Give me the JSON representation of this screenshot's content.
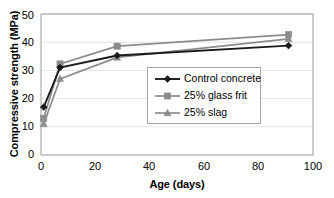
{
  "chart_data": {
    "type": "line",
    "title": "",
    "xlabel": "Age  (days)",
    "ylabel": "Compressive strength (MPa)",
    "xlim": [
      0,
      100
    ],
    "ylim": [
      0,
      50
    ],
    "xticks": [
      "0",
      "20",
      "40",
      "60",
      "80",
      "100"
    ],
    "xtick_values": [
      0,
      20,
      40,
      60,
      80,
      100
    ],
    "yticks": [
      "0",
      "10",
      "20",
      "30",
      "40",
      "50"
    ],
    "ytick_values": [
      0,
      10,
      20,
      30,
      40,
      50
    ],
    "grid": "horizontal",
    "legend_position": "center-right-inside",
    "x": [
      1,
      7,
      28,
      91
    ],
    "series": [
      {
        "name": "Control concrete",
        "marker": "diamond",
        "color": "#1a1a1a",
        "values": [
          17.0,
          31.0,
          35.3,
          38.8
        ]
      },
      {
        "name": "25% glass frit",
        "marker": "square",
        "color": "#8c8c8c",
        "values": [
          13.0,
          32.3,
          38.6,
          42.7
        ]
      },
      {
        "name": "25% slag",
        "marker": "triangle",
        "color": "#8c8c8c",
        "values": [
          11.0,
          27.0,
          34.6,
          41.2
        ]
      }
    ]
  },
  "axes": {
    "ylabel": "Compressive strength (MPa)",
    "xlabel": "Age  (days)",
    "yticks": [
      "50",
      "40",
      "30",
      "20",
      "10",
      "0"
    ],
    "xticks": [
      "0",
      "20",
      "40",
      "60",
      "80",
      "100"
    ]
  },
  "legend": {
    "items": [
      {
        "label": "Control concrete",
        "marker": "diamond-marker-icon",
        "color": "#1a1a1a"
      },
      {
        "label": "25% glass frit",
        "marker": "square-marker-icon",
        "color": "#8c8c8c"
      },
      {
        "label": "25% slag",
        "marker": "triangle-marker-icon",
        "color": "#8c8c8c"
      }
    ]
  },
  "colors": {
    "control": "#1a1a1a",
    "glass_frit": "#8c8c8c",
    "slag": "#8c8c8c",
    "axis": "#808080",
    "grid": "#e4e4e4",
    "background": "#ffffff"
  }
}
